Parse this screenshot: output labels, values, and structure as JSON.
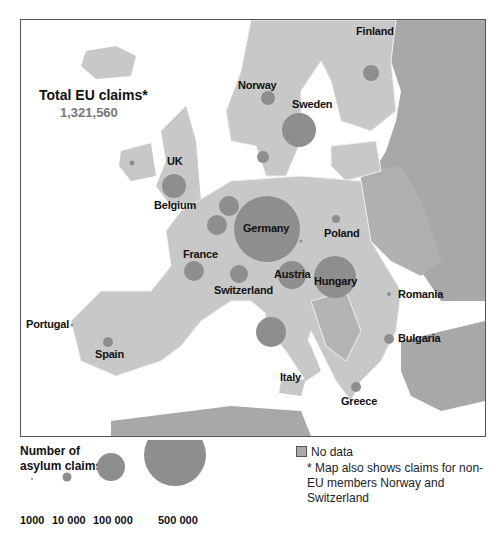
{
  "title": "Total EU claims*",
  "total": "1,321,560",
  "countries": [
    {
      "name": "Finland"
    },
    {
      "name": "Norway"
    },
    {
      "name": "Sweden"
    },
    {
      "name": "UK"
    },
    {
      "name": "Belgium"
    },
    {
      "name": "Germany"
    },
    {
      "name": "Poland"
    },
    {
      "name": "France"
    },
    {
      "name": "Austria"
    },
    {
      "name": "Hungary"
    },
    {
      "name": "Switzerland"
    },
    {
      "name": "Romania"
    },
    {
      "name": "Portugal"
    },
    {
      "name": "Spain"
    },
    {
      "name": "Italy"
    },
    {
      "name": "Bulgaria"
    },
    {
      "name": "Greece"
    }
  ],
  "legend": {
    "title_line1": "Number of",
    "title_line2": "asylum claims",
    "sizes": [
      "1000",
      "10 000",
      "100 000",
      "500 000"
    ],
    "no_data": "No data",
    "note": "* Map also shows claims for non-EU members Norway and Switzerland"
  },
  "colors": {
    "eu_land": "#c8c8c8",
    "non_eu_land": "#a8a8a8",
    "bubble": "#8e8e8e",
    "sea": "#ffffff",
    "border": "#f0f0f0"
  }
}
